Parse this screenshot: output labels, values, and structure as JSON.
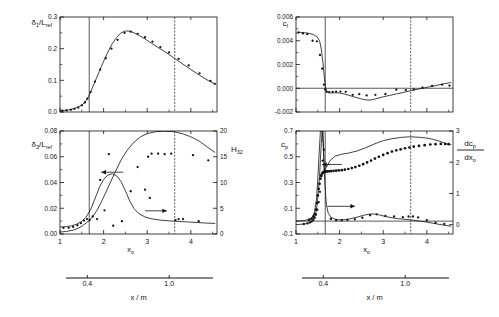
{
  "figure": {
    "caption": "",
    "secondary_axis": {
      "label": "x / m",
      "ticks": [
        "0.4",
        "1.0"
      ],
      "tick_positions": [
        0.4,
        1.0
      ],
      "range": [
        0.2,
        1.35
      ]
    },
    "primary_x": {
      "label": "x₀",
      "ticks": [
        "1",
        "2",
        "3",
        "4"
      ],
      "range": [
        1.0,
        4.6
      ]
    }
  },
  "chart_data": [
    {
      "id": "panel-top-left",
      "type": "line",
      "title": "",
      "ylabel": "δ₁/L_ref",
      "xlabel": "x₀",
      "xlim": [
        1.0,
        4.6
      ],
      "ylim": [
        0.0,
        0.3
      ],
      "yticks": [
        "0.0",
        "0.1",
        "0.2",
        "0.3"
      ],
      "ytick_values": [
        0.0,
        0.1,
        0.2,
        0.3
      ],
      "xticks": [
        "1",
        "2",
        "3",
        "4"
      ],
      "xtick_values": [
        1,
        2,
        3,
        4
      ],
      "grid": false,
      "vlines": [
        1.67,
        3.63
      ],
      "series": [
        {
          "name": "computation",
          "style": "line",
          "x": [
            1.0,
            1.1,
            1.2,
            1.3,
            1.4,
            1.5,
            1.55,
            1.6,
            1.65,
            1.7,
            1.8,
            1.9,
            2.0,
            2.1,
            2.2,
            2.3,
            2.4,
            2.5,
            2.6,
            2.7,
            2.8,
            2.9,
            3.0,
            3.1,
            3.2,
            3.4,
            3.6,
            3.8,
            4.0,
            4.2,
            4.4,
            4.55
          ],
          "y": [
            0.004,
            0.005,
            0.007,
            0.01,
            0.015,
            0.022,
            0.028,
            0.036,
            0.048,
            0.063,
            0.095,
            0.128,
            0.16,
            0.19,
            0.216,
            0.236,
            0.25,
            0.256,
            0.255,
            0.25,
            0.243,
            0.235,
            0.226,
            0.217,
            0.208,
            0.191,
            0.172,
            0.153,
            0.134,
            0.116,
            0.099,
            0.089
          ]
        },
        {
          "name": "experiment",
          "style": "points",
          "x": [
            1.05,
            1.15,
            1.25,
            1.33,
            1.42,
            1.5,
            1.57,
            1.63,
            1.7,
            1.8,
            1.92,
            2.05,
            2.18,
            2.32,
            2.48,
            2.62,
            2.78,
            2.95,
            3.12,
            3.3,
            3.5,
            3.72,
            3.95,
            4.2,
            4.45,
            4.55
          ],
          "y": [
            0.004,
            0.005,
            0.007,
            0.01,
            0.014,
            0.021,
            0.03,
            0.042,
            0.063,
            0.096,
            0.134,
            0.17,
            0.2,
            0.228,
            0.25,
            0.254,
            0.247,
            0.236,
            0.222,
            0.205,
            0.188,
            0.168,
            0.147,
            0.122,
            0.098,
            0.089
          ]
        }
      ]
    },
    {
      "id": "panel-bottom-left",
      "type": "line",
      "title": "",
      "ylabel": "δ₃/L_ref",
      "y2label": "H₃₂",
      "xlabel": "x₀",
      "xlim": [
        1.0,
        4.6
      ],
      "ylim": [
        0.0,
        0.08
      ],
      "yticks": [
        "0.00",
        "0.02",
        "0.04",
        "0.06",
        "0.08"
      ],
      "ytick_values": [
        0.0,
        0.02,
        0.04,
        0.06,
        0.08
      ],
      "y2lim": [
        0,
        20
      ],
      "y2ticks": [
        "0",
        "5",
        "10",
        "15",
        "20"
      ],
      "y2tick_values": [
        0,
        5,
        10,
        15,
        20
      ],
      "xticks": [
        "1",
        "2",
        "3",
        "4"
      ],
      "xtick_values": [
        1,
        2,
        3,
        4
      ],
      "grid": false,
      "vlines": [
        1.67,
        3.63
      ],
      "arrow_left": {
        "label": "",
        "x_from": 2.45,
        "x_to": 1.95,
        "y": 0.048
      },
      "arrow_right": {
        "label": "",
        "x_from": 2.95,
        "x_to": 3.45,
        "y": 0.018
      },
      "series": [
        {
          "name": "delta3-curve",
          "axis": "left",
          "style": "line",
          "x": [
            1.0,
            1.15,
            1.3,
            1.42,
            1.52,
            1.6,
            1.67,
            1.75,
            1.85,
            1.95,
            2.1,
            2.25,
            2.4,
            2.55,
            2.7,
            2.85,
            3.0,
            3.2,
            3.4,
            3.6,
            3.8,
            4.0,
            4.2,
            4.4,
            4.55
          ],
          "y": [
            0.0015,
            0.002,
            0.003,
            0.0045,
            0.0065,
            0.0085,
            0.0105,
            0.0135,
            0.0185,
            0.025,
            0.036,
            0.047,
            0.0575,
            0.0655,
            0.0715,
            0.0755,
            0.078,
            0.0795,
            0.0798,
            0.0795,
            0.078,
            0.0755,
            0.072,
            0.067,
            0.0635
          ]
        },
        {
          "name": "H32-curve",
          "axis": "right",
          "style": "line",
          "x": [
            1.0,
            1.12,
            1.25,
            1.38,
            1.5,
            1.6,
            1.7,
            1.8,
            1.9,
            2.0,
            2.1,
            2.2,
            2.3,
            2.4,
            2.5,
            2.6,
            2.7,
            2.8,
            2.95,
            3.1,
            3.3,
            3.5,
            3.7,
            3.9,
            4.1,
            4.3,
            4.55
          ],
          "y": [
            1.35,
            1.4,
            1.55,
            1.9,
            2.45,
            3.3,
            4.7,
            6.8,
            9.0,
            10.6,
            11.45,
            11.7,
            11.3,
            10.2,
            8.4,
            6.4,
            4.9,
            4.0,
            3.3,
            2.95,
            2.7,
            2.55,
            2.45,
            2.35,
            2.25,
            2.15,
            2.05
          ]
        },
        {
          "name": "H32-experiment",
          "axis": "right",
          "style": "points",
          "x": [
            1.08,
            1.2,
            1.3,
            1.4,
            1.48,
            1.55,
            1.62,
            1.68,
            1.75,
            1.85,
            1.92,
            2.02,
            2.12,
            2.22,
            2.42,
            2.62,
            2.78,
            2.95,
            3.02,
            3.06,
            3.1,
            3.25,
            3.4,
            3.55,
            3.65,
            3.72,
            3.82,
            4.05,
            4.18,
            4.4
          ],
          "y": [
            1.2,
            1.2,
            1.4,
            1.7,
            2.1,
            2.6,
            2.9,
            2.7,
            3.4,
            2.9,
            10.5,
            4.6,
            15.5,
            1.6,
            2.5,
            8.3,
            13.0,
            8.6,
            15.0,
            7.0,
            15.6,
            15.6,
            15.5,
            15.6,
            2.7,
            2.9,
            2.9,
            15.3,
            2.5,
            14.3
          ]
        }
      ]
    },
    {
      "id": "panel-top-right",
      "type": "line",
      "title": "",
      "ylabel": "c_f",
      "xlabel": "x₀",
      "xlim": [
        1.0,
        4.6
      ],
      "ylim": [
        -0.002,
        0.006
      ],
      "yticks": [
        "-0.002",
        "0.000",
        "0.002",
        "0.004",
        "0.006"
      ],
      "ytick_values": [
        -0.002,
        0.0,
        0.002,
        0.004,
        0.006
      ],
      "xticks": [
        "1",
        "2",
        "3",
        "4"
      ],
      "xtick_values": [
        1,
        2,
        3,
        4
      ],
      "grid": false,
      "vlines": [
        1.67,
        3.63
      ],
      "zeroline": true,
      "series": [
        {
          "name": "computation",
          "style": "line",
          "x": [
            1.0,
            1.1,
            1.2,
            1.3,
            1.4,
            1.48,
            1.54,
            1.58,
            1.62,
            1.65,
            1.68,
            1.72,
            1.8,
            1.9,
            2.0,
            2.1,
            2.2,
            2.35,
            2.5,
            2.6,
            2.7,
            2.8,
            2.9,
            3.0,
            3.15,
            3.3,
            3.5,
            3.7,
            3.9,
            4.1,
            4.3,
            4.5,
            4.55
          ],
          "y": [
            0.00465,
            0.0047,
            0.00468,
            0.00462,
            0.00452,
            0.00435,
            0.004,
            0.0033,
            0.0021,
            0.0009,
            0.0,
            -0.00035,
            -0.0004,
            -0.00038,
            -0.0004,
            -0.00048,
            -0.00058,
            -0.00075,
            -0.0009,
            -0.00098,
            -0.001,
            -0.00092,
            -0.00082,
            -0.00072,
            -0.0006,
            -0.00048,
            -0.00032,
            -0.00015,
            0.0,
            0.00015,
            0.0003,
            0.00045,
            0.00048
          ]
        },
        {
          "name": "experiment",
          "style": "points",
          "x": [
            1.06,
            1.16,
            1.26,
            1.38,
            1.48,
            1.55,
            1.6,
            1.64,
            1.67,
            1.7,
            1.76,
            1.84,
            1.92,
            2.02,
            2.14,
            2.3,
            2.45,
            2.62,
            2.82,
            3.05,
            3.3,
            3.52,
            3.7,
            3.9,
            4.12,
            4.35,
            4.52
          ],
          "y": [
            0.0047,
            0.00462,
            0.00455,
            0.004,
            0.00395,
            0.0028,
            0.00165,
            0.0003,
            -0.0001,
            -0.0003,
            -0.00032,
            -0.0003,
            -0.00028,
            -0.00028,
            -0.0003,
            -0.00055,
            -0.0005,
            -0.0006,
            -0.00055,
            -0.00048,
            -0.00012,
            -0.00015,
            -0.0001,
            5e-05,
            0.0002,
            0.0003,
            0.00022
          ]
        }
      ]
    },
    {
      "id": "panel-bottom-right",
      "type": "line",
      "title": "",
      "ylabel": "c_p",
      "y2label": "dc_p/dx₀",
      "xlabel": "x₀",
      "xlim": [
        1.0,
        4.6
      ],
      "ylim": [
        -0.1,
        0.7
      ],
      "yticks": [
        "-0.1",
        "0.1",
        "0.3",
        "0.5",
        "0.7"
      ],
      "ytick_values": [
        -0.1,
        0.1,
        0.3,
        0.5,
        0.7
      ],
      "y2lim": [
        -0.3,
        3.0
      ],
      "y2ticks": [
        "0",
        "1",
        "2",
        "3"
      ],
      "y2tick_values": [
        0,
        1,
        2,
        3
      ],
      "xticks": [
        "1",
        "2",
        "3",
        "4"
      ],
      "xtick_values": [
        1,
        2,
        3,
        4
      ],
      "grid": false,
      "vlines": [
        1.67,
        3.63
      ],
      "arrow_left": {
        "label": "",
        "x_from": 2.05,
        "x_to": 1.6,
        "y": 0.44
      },
      "arrow_right": {
        "label": "",
        "x_from": 1.72,
        "x_to": 2.35,
        "y": 0.115
      },
      "series": [
        {
          "name": "cp-curve",
          "axis": "left",
          "style": "line",
          "x": [
            1.0,
            1.2,
            1.35,
            1.42,
            1.47,
            1.5,
            1.53,
            1.56,
            1.58,
            1.6,
            1.62,
            1.65,
            1.7,
            1.78,
            1.9,
            2.05,
            2.2,
            2.4,
            2.6,
            2.8,
            3.0,
            3.2,
            3.4,
            3.6,
            3.8,
            4.0,
            4.15,
            4.3,
            4.45,
            4.55
          ],
          "y": [
            0.0,
            0.005,
            0.02,
            0.06,
            0.17,
            0.33,
            0.52,
            0.7,
            0.7,
            0.7,
            0.7,
            0.39,
            0.42,
            0.47,
            0.505,
            0.52,
            0.528,
            0.545,
            0.57,
            0.6,
            0.625,
            0.64,
            0.65,
            0.655,
            0.652,
            0.645,
            0.635,
            0.62,
            0.6,
            0.595
          ]
        },
        {
          "name": "cp-experiment",
          "axis": "left",
          "style": "points-dense",
          "x": [
            1.3,
            1.36,
            1.4,
            1.43,
            1.46,
            1.48,
            1.5,
            1.52,
            1.54,
            1.56,
            1.58,
            1.6,
            1.62,
            1.64,
            1.66,
            1.68,
            1.71,
            1.75,
            1.8,
            1.86,
            1.92,
            1.98,
            2.05,
            2.12,
            2.2,
            2.28,
            2.36,
            2.45,
            2.54,
            2.63,
            2.72,
            2.81,
            2.9,
            3.0,
            3.1,
            3.2,
            3.3,
            3.4,
            3.5,
            3.6,
            3.7,
            3.82,
            3.95,
            4.08,
            4.2,
            4.32,
            4.42,
            4.5
          ],
          "y": [
            0.01,
            0.02,
            0.035,
            0.055,
            0.09,
            0.14,
            0.2,
            0.25,
            0.29,
            0.33,
            0.355,
            0.37,
            0.378,
            0.382,
            0.384,
            0.385,
            0.386,
            0.387,
            0.388,
            0.39,
            0.392,
            0.394,
            0.396,
            0.4,
            0.405,
            0.412,
            0.42,
            0.43,
            0.442,
            0.456,
            0.47,
            0.486,
            0.5,
            0.514,
            0.528,
            0.54,
            0.55,
            0.558,
            0.566,
            0.572,
            0.578,
            0.584,
            0.59,
            0.595,
            0.598,
            0.6,
            0.6,
            0.598
          ]
        },
        {
          "name": "dcp-curve",
          "axis": "right",
          "style": "line",
          "x": [
            1.0,
            1.2,
            1.32,
            1.4,
            1.45,
            1.48,
            1.51,
            1.54,
            1.56,
            1.58,
            1.6,
            1.62,
            1.64,
            1.66,
            1.68,
            1.7,
            1.74,
            1.8,
            1.88,
            2.0,
            2.12,
            2.25,
            2.4,
            2.55,
            2.7,
            2.8,
            2.92,
            3.05,
            3.2,
            3.35,
            3.5,
            3.65,
            3.8,
            4.0,
            4.2,
            4.4,
            4.55
          ],
          "y": [
            0.0,
            0.02,
            0.06,
            0.16,
            0.35,
            0.6,
            1.0,
            1.55,
            2.1,
            2.6,
            3.0,
            2.6,
            2.0,
            1.4,
            0.95,
            0.62,
            0.36,
            0.24,
            0.18,
            0.15,
            0.16,
            0.19,
            0.24,
            0.3,
            0.34,
            0.34,
            0.31,
            0.26,
            0.22,
            0.19,
            0.17,
            0.15,
            0.12,
            0.08,
            0.03,
            -0.02,
            -0.05
          ]
        },
        {
          "name": "dcp-experiment",
          "axis": "right",
          "style": "points",
          "x": [
            1.18,
            1.26,
            1.32,
            1.36,
            1.4,
            1.43,
            1.46,
            1.49,
            1.52,
            1.55,
            1.58,
            1.61,
            1.64,
            1.8,
            1.92,
            2.05,
            2.18,
            2.35,
            2.52,
            2.7,
            2.85,
            3.05,
            3.25,
            3.45,
            3.58,
            3.68,
            3.8,
            4.0,
            4.2,
            4.4
          ],
          "y": [
            0.02,
            0.04,
            0.07,
            0.1,
            0.15,
            0.22,
            0.32,
            0.48,
            0.72,
            1.05,
            1.55,
            2.05,
            2.4,
            0.18,
            0.14,
            0.14,
            0.15,
            0.17,
            0.22,
            0.3,
            0.33,
            0.28,
            0.26,
            0.24,
            0.26,
            0.26,
            0.23,
            0.14,
            0.06,
            0.02
          ]
        }
      ]
    }
  ],
  "labels": {
    "delta1": "δ",
    "delta1_sub": "1",
    "delta1_den": "/L",
    "delta1_den_sub": "ref",
    "delta3": "δ",
    "delta3_sub": "3",
    "H": "H",
    "H_sub": "32",
    "cf": "c",
    "cf_sub": "f",
    "cp": "c",
    "cp_sub": "p",
    "dcp_num": "dc",
    "dcp_num_sub": "p",
    "dcp_den": "dx",
    "dcp_den_sub": "o",
    "x0": "x",
    "x0_sub": "o",
    "xm": "x / m"
  }
}
